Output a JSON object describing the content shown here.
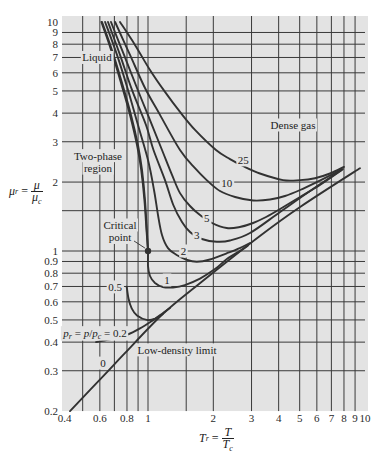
{
  "chart_data": {
    "type": "line",
    "title": "",
    "xlabel": "T_r = T / T_c",
    "ylabel": "μ_r = μ / μ_c",
    "xscale": "log",
    "yscale": "log",
    "xlim": [
      0.4,
      10
    ],
    "ylim": [
      0.2,
      10
    ],
    "grid": true,
    "legend": null,
    "xlabel_parts": {
      "lhs": "T",
      "lhs_sub": "r",
      "eq": "=",
      "num": "T",
      "den": "T",
      "den_sub": "c"
    },
    "ylabel_parts": {
      "lhs": "μ",
      "lhs_sub": "r",
      "eq": "=",
      "num": "μ",
      "den": "μ",
      "den_sub": "c"
    },
    "x_ticks": [
      0.4,
      0.6,
      0.8,
      1,
      2,
      3,
      4,
      5,
      6,
      7,
      8,
      9,
      10
    ],
    "x_tick_labels": [
      "0.4",
      "0.6",
      "0.8",
      "1",
      "2",
      "3",
      "4",
      "5",
      "6",
      "7",
      "8",
      "9",
      "10"
    ],
    "y_ticks": [
      10,
      9,
      8,
      7,
      6,
      5,
      4,
      3,
      2,
      1,
      0.9,
      0.8,
      0.7,
      0.6,
      0.5,
      0.4,
      0.3,
      0.2
    ],
    "y_tick_labels": [
      "10",
      "9",
      "8",
      "7",
      "6",
      "5",
      "4",
      "3",
      "2",
      "1",
      "0.9",
      "0.8",
      "0.7",
      "0.6",
      "0.5",
      "0.4",
      "0.3",
      "0.2"
    ],
    "x_gridlines": [
      0.5,
      0.6,
      0.7,
      0.8,
      0.9,
      1,
      1.5,
      2,
      3,
      4,
      5,
      6,
      7,
      8,
      9
    ],
    "y_gridlines": [
      0.3,
      0.4,
      0.5,
      0.6,
      0.7,
      0.8,
      0.9,
      1,
      1.5,
      2,
      3,
      4,
      5,
      6,
      7,
      8,
      9
    ],
    "colors": {
      "plot_background": "#e3e3e3",
      "grid": "#3a3a3a",
      "curve": "#323232",
      "text": "#222222"
    },
    "series": [
      {
        "name": "p_r = 0 (low-density limit)",
        "label": "0",
        "label_pos": [
          0.62,
          0.324
        ],
        "points": [
          [
            0.437,
            0.2
          ],
          [
            0.654,
            0.299
          ],
          [
            0.783,
            0.358
          ],
          [
            1.17,
            0.531
          ],
          [
            1.74,
            0.725
          ],
          [
            3.28,
            1.163
          ],
          [
            5.02,
            1.556
          ],
          [
            9.48,
            2.3
          ]
        ]
      },
      {
        "name": "p_r = 0.2",
        "label": "p_r = p/p_c = 0.2",
        "label_pos": [
          0.57,
          0.44
        ],
        "label_segments": [
          {
            "t": "p",
            "style": "italic"
          },
          {
            "t": "r",
            "style": "sub"
          },
          {
            "t": " = "
          },
          {
            "t": "p",
            "style": "italic"
          },
          {
            "t": "/"
          },
          {
            "t": "p",
            "style": "italic"
          },
          {
            "t": "c",
            "style": "sub"
          },
          {
            "t": " = 0.2"
          }
        ],
        "points": [
          [
            0.576,
            0.4
          ],
          [
            0.668,
            0.411
          ],
          [
            0.798,
            0.43
          ],
          [
            0.919,
            0.459
          ],
          [
            1.043,
            0.495
          ],
          [
            1.17,
            0.531
          ]
        ]
      },
      {
        "name": "p_r = 0.5",
        "label": "0.5",
        "label_pos": [
          0.705,
          0.697
        ],
        "points": [
          [
            0.798,
            0.698
          ],
          [
            0.813,
            0.62
          ],
          [
            0.841,
            0.562
          ],
          [
            0.89,
            0.523
          ],
          [
            0.986,
            0.5
          ],
          [
            1.077,
            0.507
          ],
          [
            1.17,
            0.535
          ],
          [
            1.263,
            0.564
          ]
        ]
      },
      {
        "name": "p_r = 1",
        "label": "1",
        "label_pos": [
          1.224,
          0.747
        ],
        "points": [
          [
            0.614,
            10
          ],
          [
            0.682,
            7.55
          ],
          [
            0.756,
            5.49
          ],
          [
            0.835,
            3.93
          ],
          [
            0.899,
            2.9
          ],
          [
            0.938,
            2.26
          ],
          [
            0.969,
            1.67
          ],
          [
            0.987,
            1.235
          ],
          [
            1.0,
            1.0
          ],
          [
            1.0,
            0.86
          ],
          [
            1.021,
            0.778
          ],
          [
            1.077,
            0.725
          ],
          [
            1.17,
            0.696
          ],
          [
            1.304,
            0.693
          ],
          [
            1.48,
            0.71
          ],
          [
            1.736,
            0.758
          ],
          [
            2.036,
            0.834
          ],
          [
            2.31,
            0.923
          ],
          [
            2.65,
            1.0
          ],
          [
            2.89,
            1.057
          ]
        ]
      },
      {
        "name": "p_r = 2",
        "label": "2",
        "label_pos": [
          1.457,
          1.0
        ],
        "points": [
          [
            0.634,
            10
          ],
          [
            0.72,
            7.18
          ],
          [
            0.809,
            5.05
          ],
          [
            0.899,
            3.55
          ],
          [
            1.0,
            2.5
          ],
          [
            1.066,
            1.846
          ],
          [
            1.112,
            1.436
          ],
          [
            1.16,
            1.175
          ],
          [
            1.236,
            1.03
          ],
          [
            1.356,
            0.961
          ],
          [
            1.497,
            0.918
          ],
          [
            1.677,
            0.898
          ],
          [
            1.93,
            0.918
          ],
          [
            2.305,
            0.977
          ],
          [
            2.65,
            1.03
          ],
          [
            2.95,
            1.084
          ]
        ]
      },
      {
        "name": "p_r = 3",
        "label": "3",
        "label_pos": [
          1.677,
          1.175
        ],
        "points": [
          [
            0.654,
            10
          ],
          [
            0.743,
            7.18
          ],
          [
            0.844,
            5.05
          ],
          [
            0.979,
            3.55
          ],
          [
            1.06,
            2.76
          ],
          [
            1.198,
            2.04
          ],
          [
            1.308,
            1.588
          ],
          [
            1.434,
            1.339
          ],
          [
            1.561,
            1.21
          ],
          [
            1.736,
            1.134
          ],
          [
            2.073,
            1.098
          ],
          [
            2.387,
            1.111
          ],
          [
            2.95,
            1.198
          ],
          [
            4.06,
            1.48
          ],
          [
            5.58,
            1.828
          ],
          [
            7.92,
            2.28
          ]
        ]
      },
      {
        "name": "p_r = 5",
        "label": "5",
        "label_pos": [
          1.865,
          1.389
        ],
        "points": [
          [
            0.675,
            10
          ],
          [
            0.775,
            7.18
          ],
          [
            0.89,
            5.15
          ],
          [
            1.021,
            3.73
          ],
          [
            1.16,
            2.76
          ],
          [
            1.29,
            2.15
          ],
          [
            1.404,
            1.79
          ],
          [
            1.561,
            1.572
          ],
          [
            1.736,
            1.436
          ],
          [
            1.972,
            1.325
          ],
          [
            2.305,
            1.26
          ],
          [
            2.65,
            1.273
          ],
          [
            3.05,
            1.325
          ],
          [
            3.5,
            1.408
          ],
          [
            4.06,
            1.525
          ],
          [
            5.02,
            1.721
          ],
          [
            6.2,
            1.942
          ],
          [
            7.83,
            2.26
          ]
        ]
      },
      {
        "name": "p_r = 10",
        "label": "10",
        "label_pos": [
          2.305,
          1.98
        ],
        "points": [
          [
            0.705,
            10
          ],
          [
            0.826,
            7.18
          ],
          [
            0.969,
            5.15
          ],
          [
            1.136,
            3.93
          ],
          [
            1.404,
            2.76
          ],
          [
            1.646,
            2.3
          ],
          [
            1.865,
            2.04
          ],
          [
            2.146,
            1.828
          ],
          [
            2.52,
            1.721
          ],
          [
            3.05,
            1.662
          ],
          [
            3.65,
            1.678
          ],
          [
            4.28,
            1.739
          ],
          [
            5.02,
            1.846
          ],
          [
            6.2,
            2.03
          ],
          [
            7.75,
            2.26
          ]
        ]
      },
      {
        "name": "p_r = 25",
        "label": "25",
        "label_pos": [
          2.75,
          2.5
        ],
        "points": [
          [
            0.743,
            10
          ],
          [
            0.871,
            7.94
          ],
          [
            1.021,
            6.17
          ],
          [
            1.198,
            4.95
          ],
          [
            1.404,
            4.05
          ],
          [
            1.646,
            3.38
          ],
          [
            2.058,
            2.76
          ],
          [
            2.387,
            2.52
          ],
          [
            2.74,
            2.35
          ],
          [
            3.28,
            2.18
          ],
          [
            4.19,
            2.04
          ],
          [
            5.02,
            2.04
          ],
          [
            5.88,
            2.08
          ],
          [
            6.9,
            2.18
          ],
          [
            8.0,
            2.33
          ]
        ]
      },
      {
        "name": "two-phase boundary",
        "label": "",
        "points": [
          [
            0.61,
            10
          ],
          [
            0.676,
            7.55
          ],
          [
            0.748,
            5.49
          ],
          [
            0.826,
            3.93
          ],
          [
            0.89,
            2.9
          ],
          [
            0.93,
            2.26
          ],
          [
            0.963,
            1.67
          ],
          [
            0.984,
            1.235
          ],
          [
            1.0,
            1.0
          ]
        ]
      }
    ],
    "critical_point": {
      "x": 1,
      "y": 1,
      "leader": [
        [
          0.862,
          1.106
        ],
        [
          0.968,
          1.03
        ]
      ]
    },
    "annotations": [
      {
        "id": "liquid",
        "lines": [
          "Liquid"
        ],
        "x": 0.582,
        "y": 7.0
      },
      {
        "id": "two-phase-region",
        "lines": [
          "Two-phase",
          "region"
        ],
        "x": 0.588,
        "y": 2.45
      },
      {
        "id": "critical-point",
        "lines": [
          "Critical",
          "point"
        ],
        "x": 0.743,
        "y": 1.22
      },
      {
        "id": "dense-gas",
        "lines": [
          "Dense gas"
        ],
        "x": 4.66,
        "y": 3.55
      },
      {
        "id": "low-density-limit",
        "lines": [
          "Low-density limit"
        ],
        "x": 1.36,
        "y": 0.37
      }
    ]
  }
}
